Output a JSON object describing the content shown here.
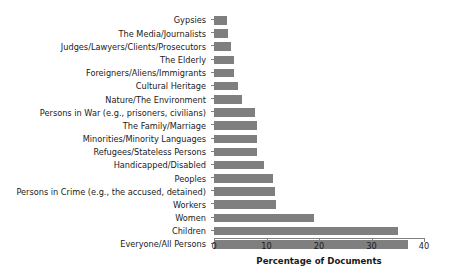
{
  "chart_data": {
    "type": "bar",
    "orientation": "horizontal",
    "title": "",
    "xlabel": "Percentage of Documents",
    "ylabel": "",
    "xlim": [
      0,
      40
    ],
    "xticks": [
      0,
      10,
      20,
      30,
      40
    ],
    "grid": false,
    "legend": null,
    "bar_color": "#7f7f7f",
    "categories": [
      "Gypsies",
      "The Media/Journalists",
      "Judges/Lawyers/Clients/Prosecutors",
      "The Elderly",
      "Foreigners/Aliens/Immigrants",
      "Cultural Heritage",
      "Nature/The Environment",
      "Persons in War (e.g., prisoners, civilians)",
      "The Family/Marriage",
      "Minorities/Minority Languages",
      "Refugees/Stateless Persons",
      "Handicapped/Disabled",
      "Peoples",
      "Persons in Crime (e.g., the accused, detained)",
      "Workers",
      "Women",
      "Children",
      "Everyone/All Persons"
    ],
    "values": [
      2.4,
      2.6,
      3.2,
      3.8,
      3.9,
      4.6,
      5.3,
      7.8,
      8.2,
      8.2,
      8.2,
      9.5,
      11.2,
      11.6,
      11.8,
      19.0,
      35.0,
      37.0
    ]
  },
  "axis": {
    "x_title": "Percentage of Documents",
    "tick_labels": [
      "0",
      "10",
      "20",
      "30",
      "40"
    ]
  }
}
